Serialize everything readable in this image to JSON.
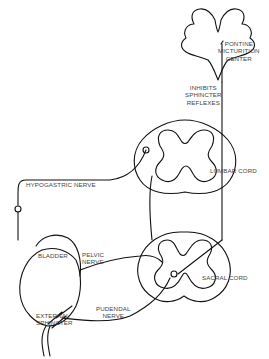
{
  "diagram": {
    "labels": {
      "pontine": "PONTINE\nMICTURITION\nCENTER",
      "inhibits": "INHIBITS\nSPHINCTER\nREFLEXES",
      "lumbar": "LUMBAR CORD",
      "hypogastric": "HYPOGASTRIC NERVE",
      "bladder": "BLADDER",
      "pelvic": "PELVIC\nNERVE",
      "sacral": "SACRAL CORD",
      "pudendal": "PUDENDAL\nNERVE",
      "external": "EXTERNAL\nSPHINCTER"
    },
    "nodes": [
      "pontine-micturition-center",
      "lumbar-cord",
      "sacral-cord",
      "bladder",
      "external-sphincter"
    ],
    "edges": [
      {
        "from": "pontine-micturition-center",
        "to": "sacral-cord",
        "label": "INHIBITS SPHINCTER REFLEXES"
      },
      {
        "from": "lumbar-cord",
        "to": "bladder",
        "label": "HYPOGASTRIC NERVE"
      },
      {
        "from": "sacral-cord",
        "to": "bladder",
        "label": "PELVIC NERVE"
      },
      {
        "from": "sacral-cord",
        "to": "external-sphincter",
        "label": "PUDENDAL NERVE"
      }
    ],
    "colors": {
      "line": "#111111",
      "text": "#444444",
      "background": "#ffffff"
    }
  }
}
